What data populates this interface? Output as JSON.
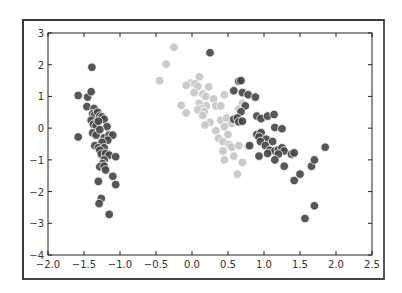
{
  "chart_data": {
    "type": "scatter",
    "title": "",
    "xlabel": "",
    "ylabel": "",
    "xlim": [
      -2.0,
      2.5
    ],
    "ylim": [
      -4,
      3
    ],
    "grid": false,
    "legend": null,
    "x_ticks": [
      "-2.0",
      "-1.5",
      "-1.0",
      "-0.5",
      "0.0",
      "0.5",
      "1.0",
      "1.5",
      "2.0",
      "2.5"
    ],
    "y_ticks": [
      "3",
      "2",
      "1",
      "0",
      "-1",
      "-2",
      "-3",
      "-4"
    ],
    "series": [
      {
        "name": "cluster-left",
        "color": "#454545",
        "points": [
          [
            -1.58,
            1.03
          ],
          [
            -1.39,
            1.92
          ],
          [
            -1.45,
            0.98
          ],
          [
            -1.4,
            1.15
          ],
          [
            -1.46,
            0.68
          ],
          [
            -1.36,
            0.62
          ],
          [
            -1.38,
            0.45
          ],
          [
            -1.35,
            0.42
          ],
          [
            -1.31,
            0.5
          ],
          [
            -1.4,
            0.25
          ],
          [
            -1.32,
            0.2
          ],
          [
            -1.28,
            0.38
          ],
          [
            -1.25,
            0.35
          ],
          [
            -1.22,
            0.28
          ],
          [
            -1.37,
            0.12
          ],
          [
            -1.33,
            0.08
          ],
          [
            -1.3,
            0.22
          ],
          [
            -1.18,
            0.05
          ],
          [
            -1.58,
            -0.28
          ],
          [
            -1.38,
            -0.15
          ],
          [
            -1.33,
            -0.22
          ],
          [
            -1.28,
            -0.05
          ],
          [
            -1.22,
            -0.3
          ],
          [
            -1.15,
            -0.22
          ],
          [
            -1.1,
            -0.22
          ],
          [
            -1.17,
            -0.38
          ],
          [
            -1.25,
            -0.45
          ],
          [
            -1.35,
            -0.55
          ],
          [
            -1.3,
            -0.62
          ],
          [
            -1.22,
            -0.62
          ],
          [
            -1.28,
            -0.7
          ],
          [
            -1.26,
            -0.82
          ],
          [
            -1.2,
            -0.8
          ],
          [
            -1.15,
            -0.85
          ],
          [
            -1.06,
            -0.9
          ],
          [
            -1.22,
            -1.0
          ],
          [
            -1.24,
            -1.12
          ],
          [
            -1.28,
            -1.22
          ],
          [
            -1.22,
            -1.2
          ],
          [
            -1.2,
            -1.32
          ],
          [
            -1.3,
            -1.68
          ],
          [
            -1.1,
            -1.52
          ],
          [
            -1.06,
            -1.78
          ],
          [
            -1.26,
            -2.22
          ],
          [
            -1.29,
            -2.38
          ],
          [
            -1.15,
            -2.72
          ]
        ]
      },
      {
        "name": "cluster-middle",
        "color": "#c8c8c8",
        "points": [
          [
            -0.25,
            2.55
          ],
          [
            -0.36,
            2.02
          ],
          [
            -0.45,
            1.5
          ],
          [
            0.1,
            1.62
          ],
          [
            -0.02,
            1.42
          ],
          [
            0.04,
            1.4
          ],
          [
            -0.08,
            1.35
          ],
          [
            0.08,
            1.32
          ],
          [
            0.23,
            1.3
          ],
          [
            0.03,
            1.12
          ],
          [
            0.15,
            1.08
          ],
          [
            0.19,
            1.0
          ],
          [
            0.45,
            1.05
          ],
          [
            0.3,
            0.92
          ],
          [
            0.1,
            0.78
          ],
          [
            -0.15,
            0.72
          ],
          [
            0.2,
            0.7
          ],
          [
            0.13,
            0.62
          ],
          [
            0.08,
            0.58
          ],
          [
            0.33,
            0.7
          ],
          [
            0.4,
            0.7
          ],
          [
            0.17,
            0.52
          ],
          [
            -0.08,
            0.48
          ],
          [
            0.15,
            0.4
          ],
          [
            0.25,
            0.18
          ],
          [
            0.18,
            0.1
          ],
          [
            0.4,
            0.25
          ],
          [
            0.48,
            0.32
          ],
          [
            0.55,
            0.15
          ],
          [
            0.6,
            0.3
          ],
          [
            0.45,
            0.05
          ],
          [
            0.33,
            -0.08
          ],
          [
            0.5,
            -0.2
          ],
          [
            0.37,
            -0.32
          ],
          [
            0.43,
            -0.42
          ],
          [
            0.52,
            -0.52
          ],
          [
            0.55,
            -0.6
          ],
          [
            0.65,
            -0.55
          ],
          [
            0.78,
            -0.58
          ],
          [
            0.43,
            -0.72
          ],
          [
            0.58,
            -0.88
          ],
          [
            0.45,
            -1.0
          ],
          [
            0.7,
            -1.08
          ],
          [
            0.63,
            -1.45
          ],
          [
            0.7,
            0.78
          ],
          [
            0.65,
            0.6
          ]
        ]
      },
      {
        "name": "cluster-right",
        "color": "#454545",
        "points": [
          [
            0.25,
            2.38
          ],
          [
            0.65,
            1.48
          ],
          [
            0.68,
            1.5
          ],
          [
            0.58,
            1.18
          ],
          [
            0.7,
            1.12
          ],
          [
            0.78,
            1.05
          ],
          [
            0.88,
            0.98
          ],
          [
            0.74,
            0.7
          ],
          [
            0.68,
            0.52
          ],
          [
            0.9,
            0.38
          ],
          [
            0.96,
            0.3
          ],
          [
            1.05,
            0.38
          ],
          [
            1.14,
            0.43
          ],
          [
            0.58,
            0.28
          ],
          [
            0.63,
            0.32
          ],
          [
            0.65,
            0.2
          ],
          [
            0.7,
            0.22
          ],
          [
            1.15,
            0.02
          ],
          [
            1.25,
            -0.02
          ],
          [
            0.9,
            -0.2
          ],
          [
            0.96,
            -0.14
          ],
          [
            0.93,
            -0.28
          ],
          [
            1.03,
            -0.35
          ],
          [
            1.12,
            -0.42
          ],
          [
            0.95,
            -0.42
          ],
          [
            1.02,
            -0.55
          ],
          [
            0.8,
            -0.55
          ],
          [
            1.08,
            -0.7
          ],
          [
            1.15,
            -0.72
          ],
          [
            1.2,
            -0.68
          ],
          [
            1.25,
            -0.62
          ],
          [
            1.28,
            -0.72
          ],
          [
            1.2,
            -0.82
          ],
          [
            1.05,
            -0.8
          ],
          [
            0.93,
            -0.88
          ],
          [
            1.38,
            -0.82
          ],
          [
            1.42,
            -0.78
          ],
          [
            1.85,
            -0.6
          ],
          [
            1.15,
            -1.0
          ],
          [
            1.28,
            -1.2
          ],
          [
            1.42,
            -1.65
          ],
          [
            1.5,
            -1.45
          ],
          [
            1.66,
            -1.2
          ],
          [
            1.7,
            -1.0
          ],
          [
            1.7,
            -2.45
          ],
          [
            1.57,
            -2.85
          ]
        ]
      }
    ]
  }
}
